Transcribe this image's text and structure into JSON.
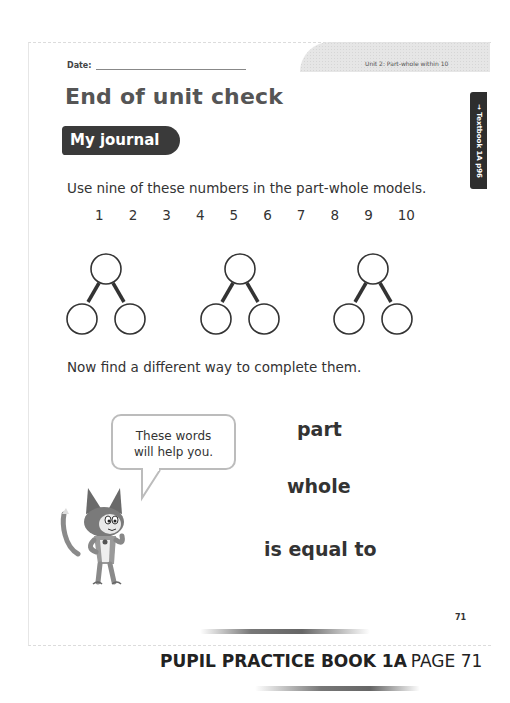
{
  "header": {
    "date_label": "Date:",
    "date_value": "",
    "unit_label": "Unit 2: Part-whole within 10",
    "side_tab": "→ Textbook 1A p96"
  },
  "main": {
    "title": "End of unit check",
    "section_badge": "My journal",
    "instruction": "Use nine of these numbers in the part-whole models.",
    "numbers": [
      "1",
      "2",
      "3",
      "4",
      "5",
      "6",
      "7",
      "8",
      "9",
      "10"
    ],
    "part_whole_models": [
      {
        "whole": "",
        "part_left": "",
        "part_right": ""
      },
      {
        "whole": "",
        "part_left": "",
        "part_right": ""
      },
      {
        "whole": "",
        "part_left": "",
        "part_right": ""
      }
    ],
    "followup": "Now find a different way to complete them.",
    "speech_bubble": {
      "line1": "These words",
      "line2": "will help you."
    },
    "word_bank": [
      "part",
      "whole",
      "is equal to"
    ],
    "character_icon": "cat-mascot-icon"
  },
  "footer": {
    "page_number": "71",
    "book_title": "PUPIL PRACTICE BOOK 1A",
    "page_label": "PAGE 71"
  },
  "colors": {
    "badge_bg": "#3a3a3a",
    "text": "#333333",
    "title": "#555555",
    "header_band": "#e2e2e2"
  }
}
